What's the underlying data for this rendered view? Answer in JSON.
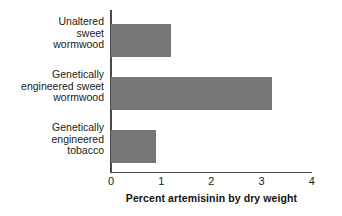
{
  "chart_data": {
    "type": "bar",
    "orientation": "horizontal",
    "title": "",
    "xlabel": "Percent artemisinin by dry weight",
    "ylabel": "",
    "categories": [
      "Unaltered\nsweet\nwormwood",
      "Genetically\nengineered sweet\nwormwood",
      "Genetically\nengineered\ntobacco"
    ],
    "values": [
      1.2,
      3.2,
      0.9
    ],
    "xlim": [
      0,
      4
    ],
    "xticks": [
      "0",
      "1",
      "2",
      "3",
      "4"
    ],
    "xtick_values": [
      0,
      1,
      2,
      3,
      4
    ],
    "grid": false,
    "legend": false,
    "bar_color": "#767676",
    "axis_color": "#4a4a4a",
    "background": "#ffffff"
  },
  "axis": {
    "x_title": "Percent artemisinin by dry weight",
    "ticks": [
      {
        "label": "0",
        "value": 0
      },
      {
        "label": "1",
        "value": 1
      },
      {
        "label": "2",
        "value": 2
      },
      {
        "label": "3",
        "value": 3
      },
      {
        "label": "4",
        "value": 4
      }
    ]
  },
  "series": [
    {
      "category": "Unaltered\nsweet\nwormwood",
      "value": 1.2
    },
    {
      "category": "Genetically\nengineered sweet\nwormwood",
      "value": 3.2
    },
    {
      "category": "Genetically\nengineered\ntobacco",
      "value": 0.9
    }
  ]
}
